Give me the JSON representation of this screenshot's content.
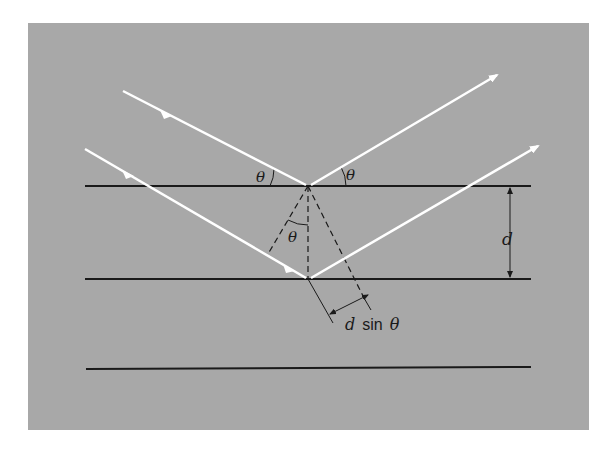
{
  "figure": {
    "colors": {
      "background": "#a8a8a8",
      "rays": "#ffffff",
      "planes": "#1a1a1a",
      "construction": "#1a1a1a"
    },
    "planes": [
      {
        "name": "plane-1",
        "y": 186
      },
      {
        "name": "plane-2",
        "y": 279
      },
      {
        "name": "plane-3",
        "y": 369
      }
    ],
    "rays": [
      {
        "name": "ray-1-incident",
        "from": [
          123,
          91
        ],
        "to": [
          308,
          186
        ]
      },
      {
        "name": "ray-1-reflected",
        "from": [
          308,
          186
        ],
        "to": [
          497,
          74
        ]
      },
      {
        "name": "ray-2-incident",
        "from": [
          85,
          149
        ],
        "to": [
          308,
          279
        ]
      },
      {
        "name": "ray-2-reflected",
        "from": [
          308,
          279
        ],
        "to": [
          538,
          145
        ]
      }
    ],
    "labels": {
      "theta_incident": "θ",
      "theta_reflected": "θ",
      "theta_inner": "θ",
      "spacing": "d",
      "path_diff_d": "d",
      "path_diff_sin": "sin",
      "path_diff_theta": "θ"
    }
  }
}
